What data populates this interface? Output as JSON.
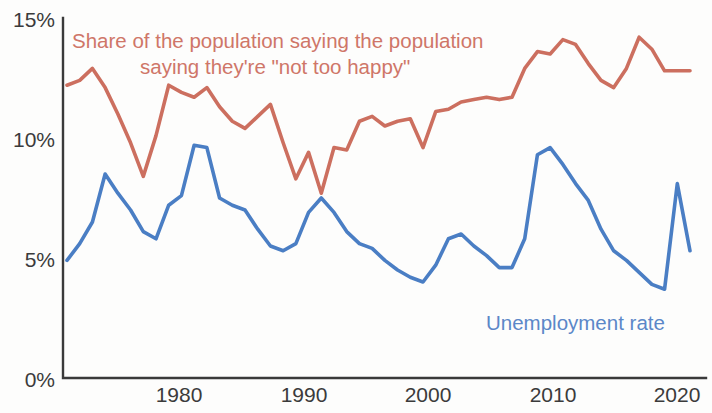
{
  "chart_data": {
    "type": "line",
    "title": "",
    "subtitle": "",
    "xlabel": "",
    "ylabel": "",
    "xlim": [
      1972,
      2021
    ],
    "ylim": [
      0,
      15
    ],
    "grid": false,
    "legend_position": "inline-annotations",
    "y_tick_labels": [
      "0%",
      "5%",
      "10%",
      "15%"
    ],
    "y_ticks": [
      0,
      5,
      10,
      15
    ],
    "x_tick_labels": [
      "1980",
      "1990",
      "2000",
      "2010",
      "2020"
    ],
    "x_ticks": [
      1980,
      1990,
      2000,
      2010,
      2020
    ],
    "x": [
      1972,
      1973,
      1974,
      1975,
      1976,
      1977,
      1978,
      1979,
      1980,
      1981,
      1982,
      1983,
      1984,
      1985,
      1986,
      1987,
      1988,
      1989,
      1990,
      1991,
      1992,
      1993,
      1994,
      1995,
      1996,
      1997,
      1998,
      1999,
      2000,
      2001,
      2002,
      2003,
      2004,
      2005,
      2006,
      2007,
      2008,
      2009,
      2010,
      2011,
      2012,
      2013,
      2014,
      2015,
      2016,
      2017,
      2018,
      2019,
      2020,
      2021
    ],
    "series": [
      {
        "name": "Share of the population saying they're \"not too happy\"",
        "color": "#cc6f5f",
        "annotation": "Share of the population saying the population saying they're \"not too happy\"",
        "values": [
          12.2,
          12.4,
          12.9,
          12.1,
          11.0,
          9.8,
          8.4,
          10.1,
          12.2,
          11.9,
          11.7,
          12.1,
          11.3,
          10.7,
          10.4,
          10.9,
          11.4,
          9.8,
          8.3,
          9.4,
          7.7,
          9.6,
          9.5,
          10.7,
          10.9,
          10.5,
          10.7,
          10.8,
          9.6,
          11.1,
          11.2,
          11.5,
          11.6,
          11.7,
          11.6,
          11.7,
          12.9,
          13.6,
          13.5,
          14.1,
          13.9,
          13.1,
          12.4,
          12.1,
          12.9,
          14.2,
          13.7,
          12.8,
          12.8,
          12.8
        ]
      },
      {
        "name": "Unemployment rate",
        "color": "#4a7ec4",
        "annotation": "Unemployment rate",
        "values": [
          4.9,
          5.6,
          6.5,
          8.5,
          7.7,
          7.0,
          6.1,
          5.8,
          7.2,
          7.6,
          9.7,
          9.6,
          7.5,
          7.2,
          7.0,
          6.2,
          5.5,
          5.3,
          5.6,
          6.9,
          7.5,
          6.9,
          6.1,
          5.6,
          5.4,
          4.9,
          4.5,
          4.2,
          4.0,
          4.7,
          5.8,
          6.0,
          5.5,
          5.1,
          4.6,
          4.6,
          5.8,
          9.3,
          9.6,
          8.9,
          8.1,
          7.4,
          6.2,
          5.3,
          4.9,
          4.4,
          3.9,
          3.7,
          8.1,
          5.3
        ]
      }
    ]
  },
  "annotations": {
    "red_line1": "Share of the population saying the population",
    "red_line2": "saying they're \"not too happy\"",
    "blue_label": "Unemployment rate"
  },
  "axes": {
    "y_labels": [
      "15%",
      "10%",
      "5%",
      "0%"
    ],
    "x_labels": [
      "1980",
      "1990",
      "2000",
      "2010",
      "2020"
    ]
  }
}
